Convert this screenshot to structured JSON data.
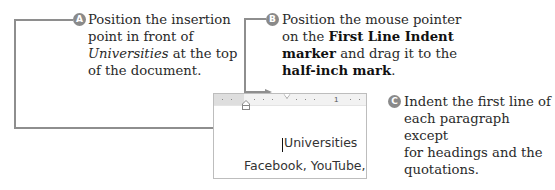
{
  "callouts": [
    {
      "badge": "A",
      "lines": [
        "Position the insertion",
        "point in front of"
      ],
      "line3_italic": "Universities",
      "line3_rest": " at the top",
      "line4": "of the document."
    },
    {
      "badge": "B",
      "line1": "Position the mouse pointer",
      "line2_pre": "on the ",
      "line2_bold": "First Line Indent",
      "line3_bold": "marker",
      "line3_rest": " and drag it to the",
      "line4_bold": "half-inch mark",
      "line4_rest": "."
    },
    {
      "badge": "C",
      "lines": [
        "Indent the first line of",
        "each paragraph except",
        "for headings and the",
        "quotations."
      ]
    }
  ],
  "document": {
    "ruler_number": "1",
    "line1": "Universities",
    "line2": "Facebook, YouTube,"
  },
  "colors": {
    "leader_line": "#8e8e8e",
    "badge": "#8a8a8a"
  }
}
